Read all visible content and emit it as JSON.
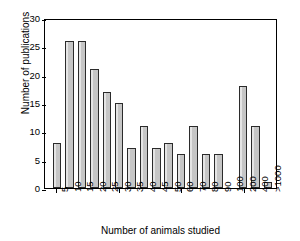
{
  "chart_data": {
    "type": "bar",
    "title": "",
    "xlabel": "Number of animals studied",
    "ylabel": "Number of publications",
    "categories": [
      "5",
      "10",
      "15",
      "20",
      "25",
      "30",
      "35",
      "40",
      "45",
      "50",
      "60",
      "70",
      "80",
      "90",
      "100",
      "200",
      "400",
      ">1000"
    ],
    "values": [
      8,
      26,
      26,
      21,
      17,
      15,
      7,
      11,
      7,
      8,
      6,
      11,
      6,
      6,
      0,
      18,
      11,
      1
    ],
    "ylim": [
      0,
      30
    ],
    "yticks": [
      0,
      5,
      10,
      15,
      20,
      25,
      30
    ],
    "ytick_labels": [
      "0",
      "5",
      "10",
      "15",
      "20",
      "25",
      "30"
    ],
    "grid": false,
    "legend": null,
    "bar_fill_color": "#c6c6c6",
    "bar_edge_color": "#2b2b2b",
    "axis_color": "#000000",
    "background_color": "#ffffff"
  }
}
